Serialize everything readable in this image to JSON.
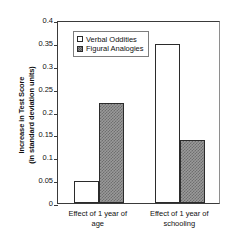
{
  "chart_data": {
    "type": "bar",
    "title": "",
    "xlabel": "",
    "ylabel_lines": [
      "Increase in Test Score",
      "(in standard deviation units)"
    ],
    "categories": [
      [
        "Effect of 1 year of",
        "age"
      ],
      [
        "Effect of 1 year of",
        "schooling"
      ]
    ],
    "series": [
      {
        "name": "Verbal Oddities",
        "values": [
          0.049,
          0.347
        ],
        "fill": "white",
        "color": "#ffffff"
      },
      {
        "name": "Figural Analogies",
        "values": [
          0.218,
          0.137
        ],
        "fill": "hatched",
        "color": "#8c8c8c"
      }
    ],
    "ylim": [
      0,
      0.4
    ],
    "ytick_values": [
      0,
      0.05,
      0.1,
      0.15,
      0.2,
      0.25,
      0.3,
      0.35,
      0.4
    ],
    "ytick_labels": [
      "0",
      "0.05",
      "0.1",
      "0.15",
      "0.2",
      "0.25",
      "0.3",
      "0.35",
      "0.4"
    ],
    "grid": false,
    "legend_position": "upper-left-inside"
  }
}
